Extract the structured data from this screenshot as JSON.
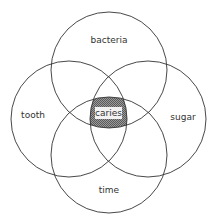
{
  "diagram": {
    "type": "venn",
    "sets": [
      {
        "id": "bacteria",
        "label": "bacteria"
      },
      {
        "id": "tooth",
        "label": "tooth"
      },
      {
        "id": "sugar",
        "label": "sugar"
      },
      {
        "id": "time",
        "label": "time"
      }
    ],
    "intersection": {
      "label": "caries",
      "sets": [
        "bacteria",
        "tooth",
        "sugar",
        "time"
      ],
      "fill": "hatched"
    },
    "colors": {
      "stroke": "#333333",
      "hatch": "#555555",
      "background": "#ffffff"
    }
  }
}
